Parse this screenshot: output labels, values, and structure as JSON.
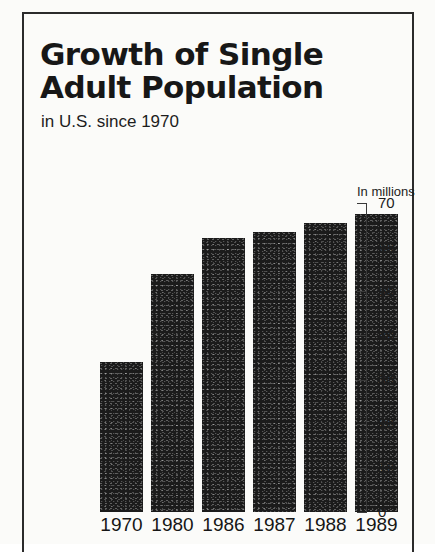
{
  "header": {
    "title_line1": "Growth of Single",
    "title_line2": "Adult Population",
    "subtitle": "in U.S. since 1970"
  },
  "axis": {
    "units_label": "In millions"
  },
  "chart_data": {
    "type": "bar",
    "title": "Growth of Single Adult Population",
    "subtitle": "in U.S. since 1970",
    "xlabel": "",
    "ylabel": "In millions",
    "ylim": [
      0,
      70
    ],
    "yticks": [
      0,
      10,
      20,
      30,
      40,
      50,
      60,
      70
    ],
    "ytick_labels": [
      "0",
      "10",
      "20",
      "30",
      "40",
      "50",
      "60",
      "70"
    ],
    "grid": false,
    "legend": false,
    "bar_color": "#1b1b1b",
    "categories": [
      "1970",
      "1980",
      "1986",
      "1987",
      "1988",
      "1989"
    ],
    "values": [
      34,
      54,
      62,
      63.5,
      65.5,
      67.5
    ],
    "series": [
      {
        "name": "Single adult population",
        "values": [
          34,
          54,
          62,
          63.5,
          65.5,
          67.5
        ]
      }
    ]
  }
}
